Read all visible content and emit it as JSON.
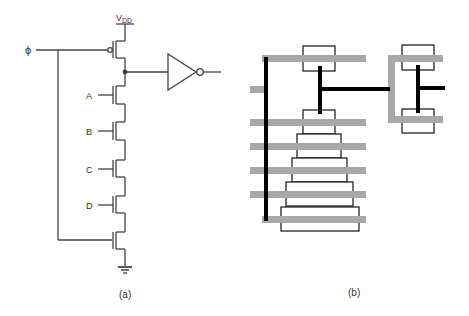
{
  "figure_a": {
    "caption": "(a)",
    "supply_label": "V",
    "supply_sub": "DD",
    "clock_label": "ϕ",
    "inputs": [
      "A",
      "B",
      "C",
      "D"
    ],
    "elements": {
      "precharge": "pmos-precharge-transistor",
      "evaluate": "nmos-evaluate-transistor",
      "output": "inverter"
    }
  },
  "figure_b": {
    "caption": "(b)",
    "description": "stick-diagram layout",
    "colors": {
      "poly": "#a8a8a8",
      "metal": "#000000",
      "diffusion_outline": "#000000"
    }
  }
}
